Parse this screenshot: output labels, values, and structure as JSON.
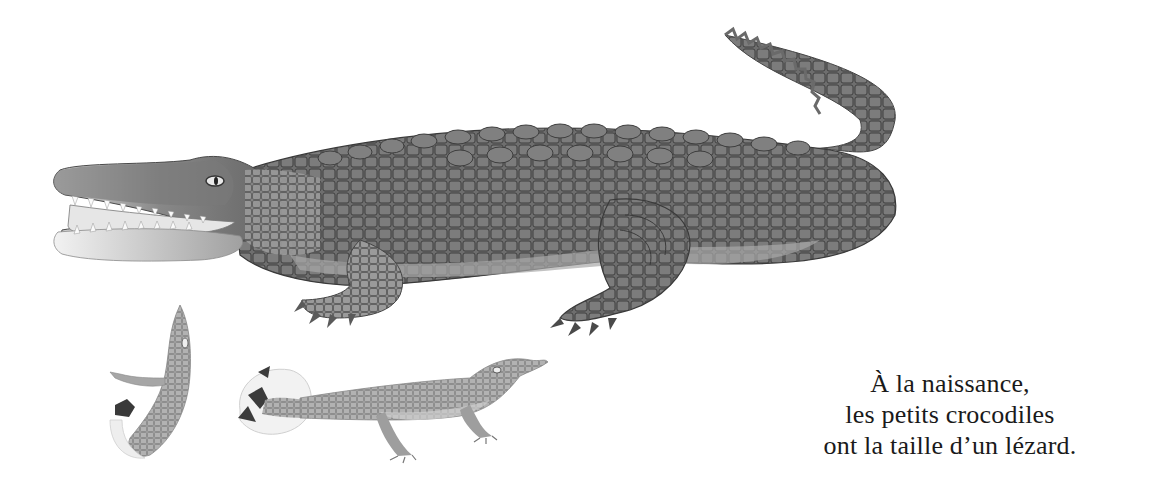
{
  "page": {
    "background": "#ffffff",
    "caption": {
      "lines": [
        "À la naissance,",
        "les petits crocodiles",
        "ont la taille d’un lézard."
      ]
    },
    "illustration": {
      "subjects": [
        "adult-crocodile",
        "hatchling-emerging-from-egg",
        "hatchling-crawling-from-egg"
      ],
      "colors": {
        "adult_body": "#6e6e6e",
        "adult_shadow": "#4a4a4a",
        "adult_light": "#9a9a9a",
        "belly": "#b8b8b8",
        "hatchling": "#a8a8a8",
        "eggshell": "#eeeeee"
      }
    }
  }
}
